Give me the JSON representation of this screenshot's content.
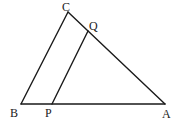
{
  "diagram": {
    "type": "geometry-triangle",
    "stroke_color": "#1a1a1a",
    "points": {
      "C": {
        "x": 68,
        "y": 12
      },
      "Q": {
        "x": 88,
        "y": 31
      },
      "B": {
        "x": 21,
        "y": 104
      },
      "P": {
        "x": 52,
        "y": 104
      },
      "A": {
        "x": 165,
        "y": 104
      }
    },
    "segments": [
      {
        "from": "B",
        "to": "C"
      },
      {
        "from": "C",
        "to": "A"
      },
      {
        "from": "B",
        "to": "A"
      },
      {
        "from": "P",
        "to": "Q"
      }
    ],
    "labels": {
      "C": "C",
      "Q": "Q",
      "B": "B",
      "P": "P",
      "A": "A"
    }
  }
}
